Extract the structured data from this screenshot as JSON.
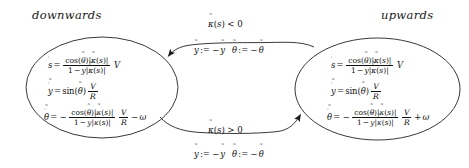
{
  "diagram": {
    "type": "hybrid-automaton-state-machine",
    "background_color": "#ffffff",
    "stroke_color": "#222222",
    "text_color": "#111111"
  },
  "states": [
    {
      "id": "downwards",
      "label": "downwards",
      "equations": [
        {
          "lhs": "ṡ",
          "rhs": "cos(θ̃)|κ̃(s)| / (1 − ỹ|κ̃(s)|) · V",
          "parts": {
            "lhs_base": "s",
            "lhs_accent": "˙",
            "numerator": "cos(θ̃)|κ̃(s)|",
            "denominator": "1 − ỹ|κ̃(s)|",
            "trailing": "V"
          }
        },
        {
          "lhs": "ỹ̇",
          "rhs": "sin(θ̃) V/R",
          "parts": {
            "lhs_base": "y",
            "func": "sin(θ̃)",
            "numerator": "V",
            "denominator": "R"
          }
        },
        {
          "lhs": "θ̃̇",
          "rhs": "− cos(θ̃)|κ̃(s)| / (1 − ỹ|κ̃(s)|) · V/R − ω",
          "parts": {
            "lhs_base": "θ",
            "sign": "−",
            "numerator": "cos(θ̃)|κ̃(s)|",
            "denominator": "1 − ỹ|κ̃(s)|",
            "frac2_num": "V",
            "frac2_den": "R",
            "omega_sign": "−",
            "omega": "ω"
          }
        }
      ]
    },
    {
      "id": "upwards",
      "label": "upwards",
      "equations": [
        {
          "lhs": "ṡ",
          "rhs": "cos(θ̃)|κ̃(s)| / (1 − ỹ|κ̃(s)|) · V",
          "parts": {
            "lhs_base": "s",
            "numerator": "cos(θ̃)|κ̃(s)|",
            "denominator": "1 − ỹ|κ̃(s)|",
            "trailing": "V"
          }
        },
        {
          "lhs": "ỹ̇",
          "rhs": "sin(θ̃) V/R",
          "parts": {
            "lhs_base": "y",
            "func": "sin(θ̃)",
            "numerator": "V",
            "denominator": "R"
          }
        },
        {
          "lhs": "θ̃̇",
          "rhs": "− cos(θ̃)|κ̃(s)| / (1 − ỹ|κ̃(s)|) · V/R + ω",
          "parts": {
            "lhs_base": "θ",
            "sign": "−",
            "numerator": "cos(θ̃)|κ̃(s)|",
            "denominator": "1 − ỹ|κ̃(s)|",
            "frac2_num": "V",
            "frac2_den": "R",
            "omega_sign": "+",
            "omega": "ω"
          }
        }
      ]
    }
  ],
  "transitions": [
    {
      "id": "upwards-to-downwards",
      "position": "top",
      "from": "upwards",
      "to": "downwards",
      "guard": "κ̃(s) < 0",
      "guard_parts": {
        "symbol": "κ",
        "arg": "(s)",
        "relation": "<",
        "value": "0"
      },
      "resets": [
        {
          "lhs": "ỹ",
          "op": ":=",
          "rhs": "−ỹ"
        },
        {
          "lhs": "θ̃",
          "op": ":=",
          "rhs": "−θ̃"
        }
      ]
    },
    {
      "id": "downwards-to-upwards",
      "position": "bottom",
      "from": "downwards",
      "to": "upwards",
      "guard": "κ̃(s) > 0",
      "guard_parts": {
        "symbol": "κ",
        "arg": "(s)",
        "relation": ">",
        "value": "0"
      },
      "resets": [
        {
          "lhs": "ỹ",
          "op": ":=",
          "rhs": "−ỹ"
        },
        {
          "lhs": "θ̃",
          "op": ":=",
          "rhs": "−θ̃"
        }
      ]
    }
  ],
  "symbols": {
    "assign": ":=",
    "minus": "−",
    "plus": "+",
    "less_than": "<",
    "greater_than": ">",
    "zero": "0",
    "one": "1",
    "V": "V",
    "R": "R",
    "s": "s",
    "y": "y",
    "theta": "θ",
    "kappa": "κ",
    "omega": "ω",
    "cos": "cos",
    "sin": "sin",
    "bar": "|",
    "lparen": "(",
    "rparen": ")",
    "tilde": "˜",
    "dot": "˙",
    "equals": "="
  }
}
